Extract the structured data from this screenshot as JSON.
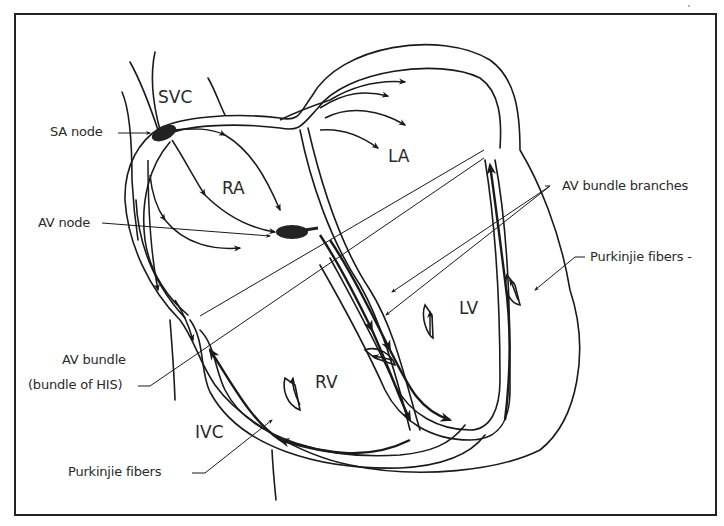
{
  "figure": {
    "chambers": {
      "svc": "SVC",
      "ra": "RA",
      "la": "LA",
      "rv": "RV",
      "lv": "LV",
      "ivc": "IVC"
    },
    "labels": {
      "sa_node": "SA node",
      "av_node": "AV node",
      "av_bundle_line1": "AV  bundle",
      "av_bundle_line2": "(bundle of HIS)",
      "purkinje_left": "Purkinjie fibers",
      "av_bundle_branches": "AV  bundle branches",
      "purkinje_right": "Purkinjie fibers  -"
    },
    "colors": {
      "stroke": "#1a1a1a",
      "node_fill": "#222222",
      "background": "#ffffff"
    }
  }
}
